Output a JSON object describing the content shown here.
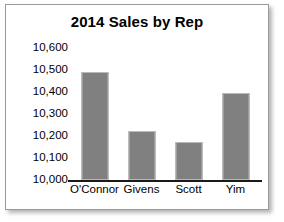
{
  "chart_data": {
    "type": "bar",
    "title": "2014 Sales by Rep",
    "xlabel": "",
    "ylabel": "",
    "categories": [
      "O'Connor",
      "Givens",
      "Scott",
      "Yim"
    ],
    "values": [
      10490,
      10225,
      10175,
      10395
    ],
    "ylim": [
      10000,
      10600
    ],
    "ytick_values": [
      10600,
      10500,
      10400,
      10300,
      10200,
      10100,
      10000
    ],
    "ytick_labels": [
      "10,600",
      "10,500",
      "10,400",
      "10,300",
      "10,200",
      "10,100",
      "10,000"
    ],
    "grid": false,
    "legend": false,
    "legend_position": "none",
    "bar_color": "#808080",
    "bar_edge_color": "#b9b9b9",
    "plot_background": "#ffffff",
    "axis_color": "#1a1a1a",
    "frame_color": "#9a9a9a",
    "title_color": "#000000",
    "tick_label_color": "#000000"
  }
}
